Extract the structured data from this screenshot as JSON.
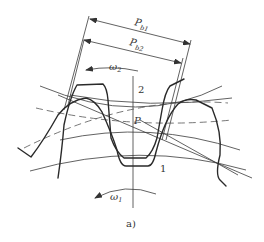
{
  "figure": {
    "caption": "a)",
    "labels": {
      "pb1_main": "P",
      "pb1_sub": "b1",
      "pb2_main": "P",
      "pb2_sub": "b2",
      "omega2_main": "ω",
      "omega2_sub": "2",
      "omega1_main": "ω",
      "omega1_sub": "1",
      "pitch_point": "P",
      "gear_upper": "2",
      "gear_lower": "1"
    }
  }
}
